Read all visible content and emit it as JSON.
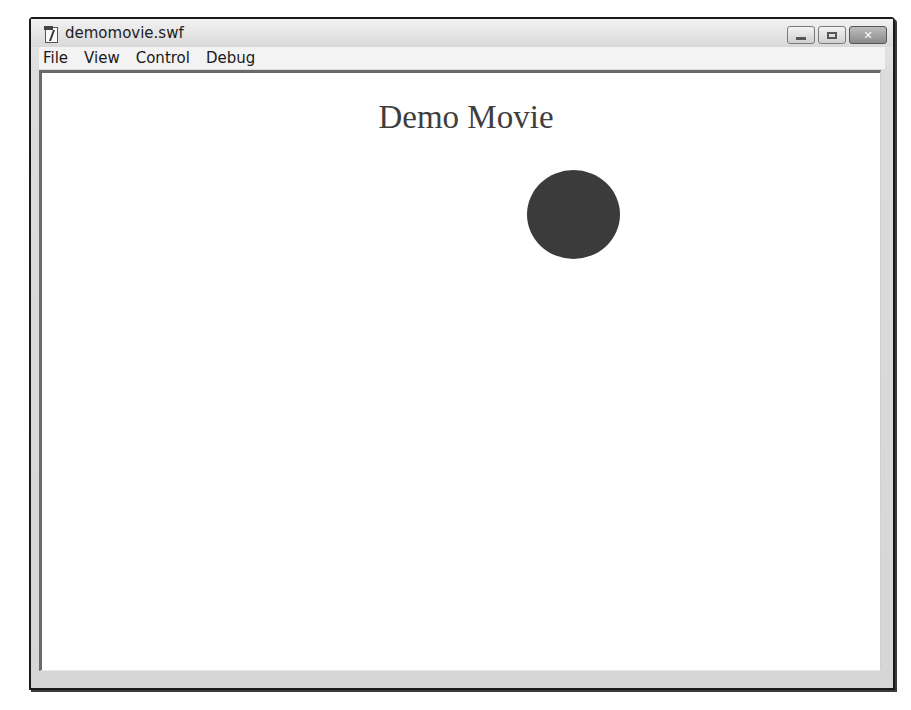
{
  "window": {
    "title": "demomovie.swf",
    "icon": "flash-document-icon",
    "controls": {
      "minimize": "minimize-icon",
      "maximize": "maximize-icon",
      "close": "close-icon",
      "close_glyph": "✕"
    }
  },
  "menubar": {
    "items": [
      {
        "label": "File"
      },
      {
        "label": "View"
      },
      {
        "label": "Control"
      },
      {
        "label": "Debug"
      }
    ]
  },
  "stage": {
    "title": "Demo Movie",
    "shapes": [
      {
        "type": "circle",
        "color": "#3b3b3b"
      }
    ]
  }
}
